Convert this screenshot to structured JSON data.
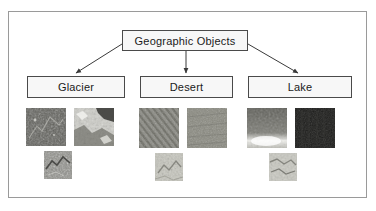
{
  "diagram": {
    "root": {
      "label": "Geographic Objects"
    },
    "categories": [
      {
        "label": "Glacier",
        "thumbnails": [
          {
            "name": "glacier-thumbnail-1",
            "alt": "dark mottled glacier terrain"
          },
          {
            "name": "glacier-thumbnail-2",
            "alt": "bright ice and snow coastline"
          },
          {
            "name": "glacier-thumbnail-3",
            "alt": "grey glacier valley detail"
          }
        ]
      },
      {
        "label": "Desert",
        "thumbnails": [
          {
            "name": "desert-thumbnail-1",
            "alt": "rippled sand dune field"
          },
          {
            "name": "desert-thumbnail-2",
            "alt": "flat uniform sand plain"
          },
          {
            "name": "desert-thumbnail-3",
            "alt": "pale desert basin detail"
          }
        ]
      },
      {
        "label": "Lake",
        "thumbnails": [
          {
            "name": "lake-thumbnail-1",
            "alt": "lake shoreline with bright sediment"
          },
          {
            "name": "lake-thumbnail-2",
            "alt": "very dark deep water surface"
          },
          {
            "name": "lake-thumbnail-3",
            "alt": "pale lake inlet detail"
          }
        ]
      }
    ],
    "colors": {
      "frame_border": "#9a9a9a",
      "node_border": "#4a4a4a",
      "node_fill": "#f7f7f7",
      "connector": "#3a3a3a",
      "text": "#1a1a1a"
    }
  }
}
